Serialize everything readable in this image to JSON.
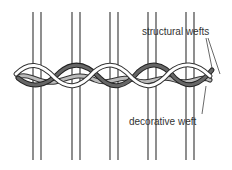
{
  "diagram": {
    "type": "weaving-illustration",
    "labels": {
      "structural": "structural wefts",
      "decorative": "decorative weft"
    },
    "warp_pairs_x": [
      [
        33,
        41
      ],
      [
        72,
        80
      ],
      [
        110,
        118
      ],
      [
        148,
        156
      ],
      [
        186,
        194
      ]
    ],
    "warp_y_range": [
      12,
      160
    ],
    "colors": {
      "warp": "#444444",
      "structural_light": "#ffffff",
      "structural_dark": "#666666",
      "decorative": "#bbbbbb",
      "outline": "#333333"
    }
  }
}
